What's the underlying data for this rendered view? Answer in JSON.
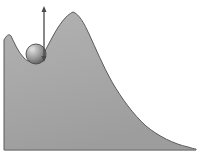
{
  "figure": {
    "title": "Energy landscape with trapped sphere and barrier-height arrow",
    "width": 203,
    "height": 161,
    "background_color": "#ffffff"
  },
  "colors": {
    "terrain_fill": "#a8a8a8",
    "terrain_fill_light": "#b4b4b4",
    "terrain_fill_dark": "#9a9a9a",
    "terrain_outline": "#5a5a5a",
    "sphere_light": "#d8d8d8",
    "sphere_mid": "#9e9e9e",
    "sphere_dark": "#595959",
    "sphere_outline": "#4a4a4a",
    "arrow_color": "#4a4a4a",
    "baseline_color": "#8f8f8f"
  },
  "terrain": {
    "name": "energy-curve",
    "description": "Filled gray curve: small left shoulder peak, local minimum well, tall central maximum, long decaying tail to the right",
    "left_shoulder_peak": {
      "x": 11,
      "y": 36
    },
    "well_minimum": {
      "x": 33,
      "y": 62
    },
    "main_peak": {
      "x": 73,
      "y": 12
    },
    "tail_end": {
      "x": 196,
      "y": 149
    },
    "baseline_y": 150,
    "path": "M 4,150 L 4,40 C 6,36 9,33 11,36 C 14,42 18,52 24,58 C 28,62 32,63 36,61 C 42,58 47,47 53,36 C 59,25 66,15 73,12 C 79,14 84,23 89,34 C 96,49 103,66 112,82 C 122,99 133,114 146,126 C 158,136 174,144 188,147 C 192,148 194,149 196,149 L 196,150 Z"
  },
  "sphere": {
    "name": "ball",
    "description": "Shaded sphere resting in the local minimum of the curve",
    "center_x": 36,
    "center_y": 54,
    "radius": 10,
    "highlight_x": 32,
    "highlight_y": 49
  },
  "arrow": {
    "name": "barrier-height-arrow",
    "description": "Vertical double-headed arrow measuring height from sphere level to peak level",
    "x": 44,
    "top_y": 6,
    "bottom_y": 62,
    "head_length": 6,
    "head_width": 5,
    "double_headed": true,
    "label": ""
  },
  "chart_data": {
    "type": "area",
    "title": "Energy landscape with trapped sphere and barrier-height arrow",
    "xlabel": "",
    "ylabel": "",
    "grid": false,
    "legend": "none",
    "x": [
      4,
      11,
      24,
      33,
      43,
      53,
      63,
      73,
      83,
      93,
      106,
      120,
      135,
      150,
      165,
      180,
      196
    ],
    "values": [
      110,
      114,
      92,
      88,
      101,
      114,
      130,
      138,
      124,
      104,
      80,
      58,
      40,
      25,
      14,
      7,
      1
    ],
    "ylim": [
      0,
      150
    ],
    "xlim": [
      4,
      196
    ],
    "annotations": [
      {
        "kind": "sphere",
        "x": 36,
        "y": 96,
        "note": "sphere resting in local energy minimum"
      },
      {
        "kind": "double-arrow",
        "x": 44,
        "y_from": 88,
        "y_to": 144,
        "note": "barrier height from well to peak"
      }
    ]
  }
}
